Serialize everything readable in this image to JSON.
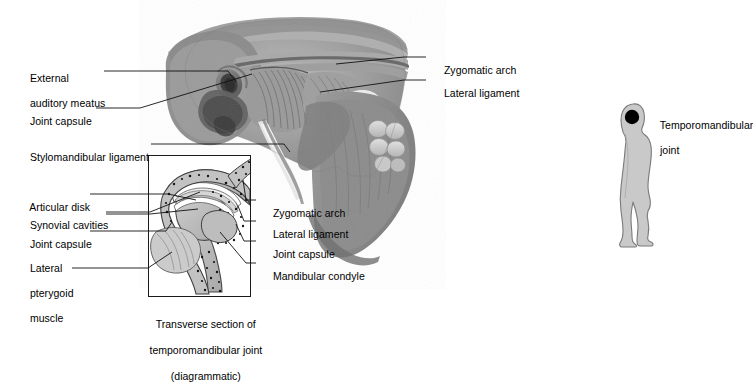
{
  "figure": {
    "background_color": "#ffffff",
    "text_color": "#000000"
  },
  "main_photo": {
    "type": "grayscale-cadaver-dissection",
    "description": "Lateral view dissection of the temporomandibular joint region showing zygomatic arch, lateral ligament, joint capsule and mandible with molar teeth",
    "tones": [
      "#f2f2f2",
      "#cfcfcf",
      "#a8a8a8",
      "#8c8c8c",
      "#6e6e6e",
      "#4f4f4f",
      "#333333"
    ]
  },
  "labels_main": [
    {
      "id": "external-auditory-meatus",
      "text": "External\nauditory meatus",
      "side": "left"
    },
    {
      "id": "joint-capsule-main",
      "text": "Joint capsule",
      "side": "left"
    },
    {
      "id": "stylomandibular-ligament",
      "text": "Stylomandibular ligament",
      "side": "left"
    },
    {
      "id": "zygomatic-arch-main",
      "text": "Zygomatic arch",
      "side": "right"
    },
    {
      "id": "lateral-ligament-main",
      "text": "Lateral ligament",
      "side": "right"
    }
  ],
  "labels_inset": [
    {
      "id": "articular-disk",
      "text": "Articular disk",
      "side": "left"
    },
    {
      "id": "synovial-cavities",
      "text": "Synovial cavities",
      "side": "left"
    },
    {
      "id": "joint-capsule-inset",
      "text": "Joint capsule",
      "side": "left"
    },
    {
      "id": "lateral-pterygoid-muscle",
      "text": "Lateral\npterygoid\nmuscle",
      "side": "left"
    },
    {
      "id": "zygomatic-arch-inset",
      "text": "Zygomatic arch",
      "side": "right"
    },
    {
      "id": "lateral-ligament-inset",
      "text": "Lateral ligament",
      "side": "right"
    },
    {
      "id": "joint-capsule-inset-right",
      "text": "Joint capsule",
      "side": "right"
    },
    {
      "id": "mandibular-condyle",
      "text": "Mandibular condyle",
      "side": "right"
    }
  ],
  "inset": {
    "caption": "Transverse section of\ntemporomandibular joint\n(diagrammatic)",
    "border_color": "#1a1a1a"
  },
  "orientation_figure": {
    "label": "Temporomandibular\njoint",
    "silhouette_fill": "#c9c9c9",
    "silhouette_stroke": "#7a7a7a",
    "marker_color": "#000000",
    "marker_shape": "circle"
  },
  "label_text": {
    "external_auditory_meatus_l1": "External",
    "external_auditory_meatus_l2": "auditory meatus",
    "joint_capsule": "Joint capsule",
    "stylomandibular_ligament": "Stylomandibular ligament",
    "zygomatic_arch": "Zygomatic arch",
    "lateral_ligament": "Lateral ligament",
    "articular_disk": "Articular disk",
    "synovial_cavities": "Synovial cavities",
    "lateral_pterygoid_l1": "Lateral",
    "lateral_pterygoid_l2": "pterygoid",
    "lateral_pterygoid_l3": "muscle",
    "mandibular_condyle": "Mandibular condyle",
    "caption_l1": "Transverse section of",
    "caption_l2": "temporomandibular joint",
    "caption_l3": "(diagrammatic)",
    "tmj_l1": "Temporomandibular",
    "tmj_l2": "joint"
  }
}
